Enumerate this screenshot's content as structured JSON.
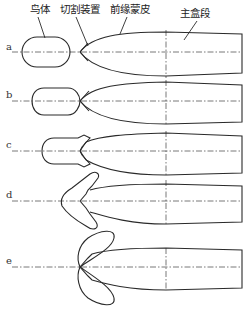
{
  "figure": {
    "callouts": {
      "bird": "鸟体",
      "cutter": "切割装置",
      "leading_edge_skin": "前缘蒙皮",
      "main_box": "主盒段"
    },
    "stages": [
      {
        "label": "a"
      },
      {
        "label": "b"
      },
      {
        "label": "c"
      },
      {
        "label": "d"
      },
      {
        "label": "e"
      }
    ]
  }
}
